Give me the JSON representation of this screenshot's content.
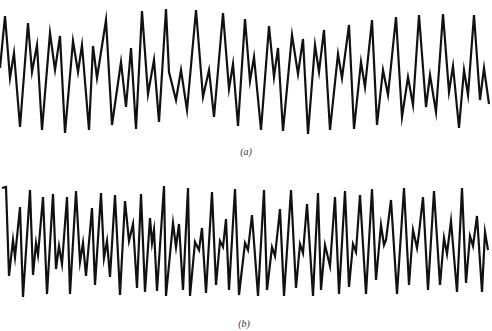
{
  "figure": {
    "panels": [
      {
        "label": "(a)",
        "caption_text": "(a)"
      },
      {
        "label": "(b)",
        "caption_text": "(b)"
      }
    ],
    "line_color": "#111111",
    "background": "#ffffff"
  },
  "chart_data": [
    {
      "type": "line",
      "title": "(a)",
      "xlabel": "",
      "ylabel": "",
      "grid": false,
      "axes_visible": false,
      "description": "Periodic waveform with a dominant peak followed by a smaller double-hump, slowly varying envelope",
      "points_px": [
        [
          0,
          68
        ],
        [
          5,
          16
        ],
        [
          10,
          78
        ],
        [
          14,
          53
        ],
        [
          20,
          127
        ],
        [
          28,
          23
        ],
        [
          32,
          72
        ],
        [
          37,
          45
        ],
        [
          42,
          130
        ],
        [
          50,
          33
        ],
        [
          55,
          70
        ],
        [
          60,
          36
        ],
        [
          65,
          133
        ],
        [
          73,
          41
        ],
        [
          78,
          72
        ],
        [
          82,
          45
        ],
        [
          89,
          130
        ],
        [
          93,
          46
        ],
        [
          97,
          78
        ],
        [
          106,
          20
        ],
        [
          112,
          125
        ],
        [
          121,
          62
        ],
        [
          126,
          107
        ],
        [
          131,
          48
        ],
        [
          136,
          129
        ],
        [
          142,
          11
        ],
        [
          148,
          94
        ],
        [
          154,
          60
        ],
        [
          159,
          122
        ],
        [
          166,
          9
        ],
        [
          169,
          72
        ],
        [
          176,
          100
        ],
        [
          181,
          70
        ],
        [
          187,
          110
        ],
        [
          196,
          10
        ],
        [
          203,
          97
        ],
        [
          209,
          70
        ],
        [
          214,
          117
        ],
        [
          223,
          13
        ],
        [
          229,
          89
        ],
        [
          233,
          64
        ],
        [
          238,
          126
        ],
        [
          245,
          19
        ],
        [
          250,
          81
        ],
        [
          254,
          57
        ],
        [
          261,
          130
        ],
        [
          269,
          26
        ],
        [
          274,
          77
        ],
        [
          278,
          48
        ],
        [
          283,
          131
        ],
        [
          292,
          35
        ],
        [
          298,
          74
        ],
        [
          303,
          39
        ],
        [
          308,
          134
        ],
        [
          315,
          45
        ],
        [
          319,
          72
        ],
        [
          324,
          30
        ],
        [
          330,
          130
        ],
        [
          338,
          54
        ],
        [
          342,
          78
        ],
        [
          349,
          25
        ],
        [
          354,
          129
        ],
        [
          361,
          62
        ],
        [
          365,
          87
        ],
        [
          372,
          20
        ],
        [
          377,
          125
        ],
        [
          383,
          70
        ],
        [
          388,
          95
        ],
        [
          396,
          17
        ],
        [
          402,
          117
        ],
        [
          408,
          77
        ],
        [
          413,
          105
        ],
        [
          419,
          15
        ],
        [
          426,
          107
        ],
        [
          430,
          75
        ],
        [
          436,
          112
        ],
        [
          443,
          14
        ],
        [
          449,
          92
        ],
        [
          453,
          66
        ],
        [
          459,
          128
        ],
        [
          464,
          70
        ],
        [
          468,
          95
        ],
        [
          474,
          15
        ],
        [
          480,
          100
        ],
        [
          484,
          68
        ],
        [
          489,
          104
        ]
      ]
    },
    {
      "type": "line",
      "title": "(b)",
      "xlabel": "",
      "ylabel": "",
      "grid": false,
      "axes_visible": false,
      "description": "Higher-frequency periodic waveform with a tall peak and two small intermediate humps per cycle",
      "points_px": [
        [
          2,
          188
        ],
        [
          6,
          187
        ],
        [
          9,
          276
        ],
        [
          13,
          240
        ],
        [
          15,
          257
        ],
        [
          20,
          207
        ],
        [
          23,
          297
        ],
        [
          30,
          190
        ],
        [
          33,
          275
        ],
        [
          36,
          243
        ],
        [
          38,
          255
        ],
        [
          43,
          197
        ],
        [
          47,
          294
        ],
        [
          53,
          194
        ],
        [
          56,
          269
        ],
        [
          59,
          246
        ],
        [
          62,
          264
        ],
        [
          67,
          197
        ],
        [
          70,
          294
        ],
        [
          76,
          191
        ],
        [
          80,
          262
        ],
        [
          83,
          243
        ],
        [
          86,
          276
        ],
        [
          92,
          208
        ],
        [
          95,
          285
        ],
        [
          101,
          193
        ],
        [
          104,
          258
        ],
        [
          107,
          241
        ],
        [
          110,
          277
        ],
        [
          115,
          195
        ],
        [
          120,
          295
        ],
        [
          125,
          201
        ],
        [
          129,
          241
        ],
        [
          133,
          224
        ],
        [
          137,
          288
        ],
        [
          141,
          194
        ],
        [
          145,
          292
        ],
        [
          150,
          218
        ],
        [
          152,
          243
        ],
        [
          154,
          230
        ],
        [
          157,
          291
        ],
        [
          164,
          186
        ],
        [
          166,
          296
        ],
        [
          173,
          223
        ],
        [
          176,
          247
        ],
        [
          179,
          224
        ],
        [
          183,
          290
        ],
        [
          188,
          188
        ],
        [
          190,
          296
        ],
        [
          195,
          242
        ],
        [
          199,
          250
        ],
        [
          202,
          228
        ],
        [
          206,
          293
        ],
        [
          212,
          192
        ],
        [
          216,
          285
        ],
        [
          220,
          241
        ],
        [
          223,
          247
        ],
        [
          226,
          219
        ],
        [
          229,
          290
        ],
        [
          235,
          189
        ],
        [
          239,
          295
        ],
        [
          245,
          243
        ],
        [
          248,
          250
        ],
        [
          252,
          215
        ],
        [
          258,
          296
        ],
        [
          264,
          190
        ],
        [
          267,
          290
        ],
        [
          272,
          247
        ],
        [
          275,
          256
        ],
        [
          280,
          209
        ],
        [
          284,
          296
        ],
        [
          291,
          190
        ],
        [
          296,
          288
        ],
        [
          300,
          244
        ],
        [
          303,
          253
        ],
        [
          307,
          204
        ],
        [
          313,
          296
        ],
        [
          318,
          193
        ],
        [
          321,
          290
        ],
        [
          325,
          245
        ],
        [
          330,
          266
        ],
        [
          335,
          197
        ],
        [
          339,
          294
        ],
        [
          345,
          191
        ],
        [
          349,
          287
        ],
        [
          353,
          244
        ],
        [
          356,
          252
        ],
        [
          360,
          195
        ],
        [
          366,
          294
        ],
        [
          372,
          189
        ],
        [
          376,
          280
        ],
        [
          381,
          225
        ],
        [
          384,
          245
        ],
        [
          386,
          240
        ],
        [
          391,
          200
        ],
        [
          397,
          294
        ],
        [
          404,
          188
        ],
        [
          409,
          285
        ],
        [
          413,
          230
        ],
        [
          417,
          248
        ],
        [
          419,
          233
        ],
        [
          423,
          197
        ],
        [
          428,
          290
        ],
        [
          434,
          191
        ],
        [
          440,
          285
        ],
        [
          444,
          238
        ],
        [
          447,
          254
        ],
        [
          451,
          221
        ],
        [
          457,
          292
        ],
        [
          462,
          188
        ],
        [
          466,
          283
        ],
        [
          470,
          236
        ],
        [
          473,
          246
        ],
        [
          477,
          216
        ],
        [
          482,
          292
        ],
        [
          485,
          232
        ],
        [
          488,
          250
        ]
      ]
    }
  ]
}
